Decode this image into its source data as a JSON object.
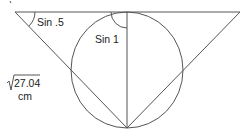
{
  "diagram": {
    "type": "geometry",
    "labels": {
      "left_angle": "Sin .5",
      "top_angle": "Sin 1",
      "side_length_value": "27.04",
      "side_length_unit": "cm"
    },
    "colors": {
      "stroke": "#555555",
      "text": "#222222",
      "background": "#ffffff"
    }
  }
}
